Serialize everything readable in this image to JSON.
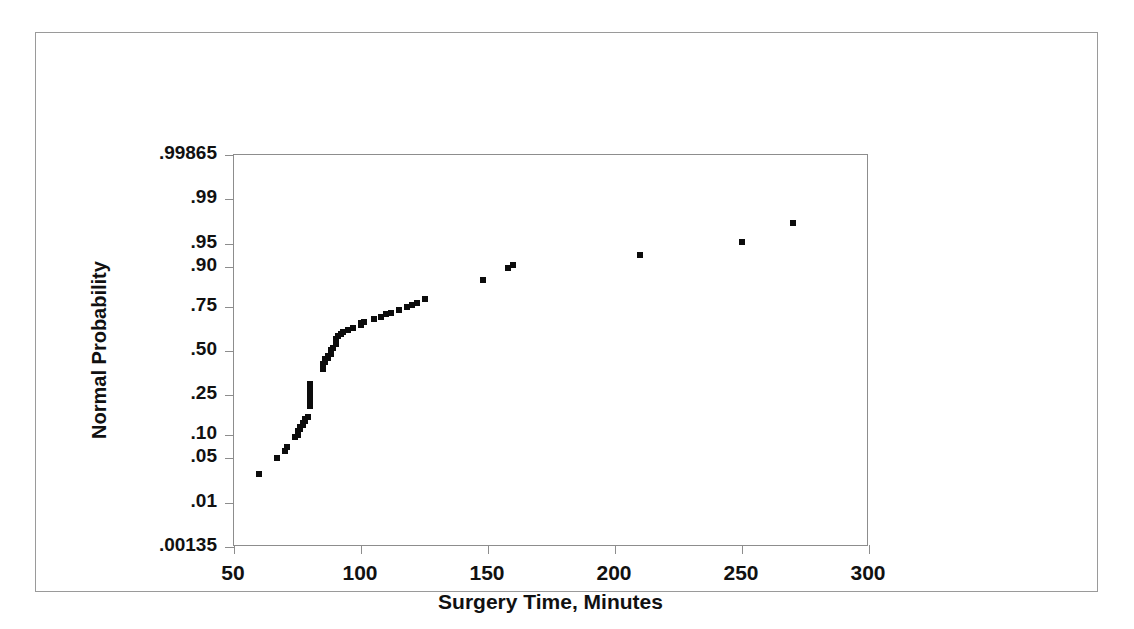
{
  "figure": {
    "type": "normal-probability-plot",
    "background_color": "#ffffff",
    "frame_color": "#9a9a9a",
    "marker_color": "#0c0c0c"
  },
  "chart_data": {
    "type": "scatter",
    "title": "",
    "subtitle": "",
    "xlabel": "Surgery Time, Minutes",
    "ylabel": "Normal Probability",
    "xlim": [
      50,
      300
    ],
    "ylim": [
      0.00135,
      0.99865
    ],
    "yscale": "normal-probability",
    "grid": false,
    "legend": null,
    "annotations": [],
    "xticks": [
      50,
      100,
      150,
      200,
      250,
      300
    ],
    "xticklabels": [
      "50",
      "100",
      "150",
      "200",
      "250",
      "300"
    ],
    "yticks": [
      0.00135,
      0.01,
      0.05,
      0.1,
      0.25,
      0.5,
      0.75,
      0.9,
      0.95,
      0.99,
      0.99865
    ],
    "yticklabels": [
      ".00135",
      ".01",
      ".05",
      ".10",
      ".25",
      ".50",
      ".75",
      ".90",
      ".95",
      ".99",
      ".99865"
    ],
    "series": [
      {
        "name": "Surgery Time",
        "marker": "square",
        "x": [
          60,
          67,
          70,
          71,
          74,
          75,
          75,
          76,
          76,
          77,
          77,
          78,
          78,
          79,
          80,
          80,
          80,
          80,
          80,
          80,
          80,
          80,
          85,
          85,
          85,
          86,
          86,
          87,
          87,
          88,
          88,
          88,
          89,
          90,
          90,
          90,
          91,
          92,
          93,
          95,
          97,
          100,
          100,
          101,
          105,
          108,
          110,
          112,
          115,
          118,
          120,
          122,
          125,
          148,
          158,
          160,
          210,
          250,
          270
        ],
        "y": [
          0.03,
          0.05,
          0.063,
          0.07,
          0.093,
          0.1,
          0.11,
          0.115,
          0.122,
          0.128,
          0.135,
          0.142,
          0.15,
          0.158,
          0.2,
          0.215,
          0.23,
          0.245,
          0.26,
          0.275,
          0.29,
          0.305,
          0.39,
          0.405,
          0.42,
          0.435,
          0.45,
          0.46,
          0.47,
          0.48,
          0.492,
          0.505,
          0.52,
          0.545,
          0.56,
          0.575,
          0.59,
          0.6,
          0.612,
          0.625,
          0.64,
          0.655,
          0.665,
          0.672,
          0.69,
          0.7,
          0.712,
          0.722,
          0.735,
          0.748,
          0.76,
          0.77,
          0.785,
          0.862,
          0.898,
          0.905,
          0.93,
          0.952,
          0.975
        ]
      }
    ]
  }
}
